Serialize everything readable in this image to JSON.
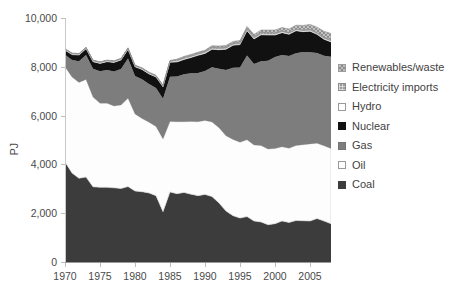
{
  "chart_data": {
    "type": "area",
    "title": "",
    "subtitle": "",
    "xlabel": "",
    "ylabel": "PJ",
    "xlim": [
      1970,
      2008
    ],
    "ylim": [
      0,
      10000
    ],
    "grid": false,
    "stacked": true,
    "legend_position": "right",
    "y_ticks": [
      "0",
      "2,000",
      "4,000",
      "6,000",
      "8,000",
      "10,000"
    ],
    "y_tick_values": [
      0,
      2000,
      4000,
      6000,
      8000,
      10000
    ],
    "x_ticks": [
      "1970",
      "1975",
      "1980",
      "1985",
      "1990",
      "1995",
      "2000",
      "2005"
    ],
    "x_tick_values": [
      1970,
      1975,
      1980,
      1985,
      1990,
      1995,
      2000,
      2005
    ],
    "x": [
      1970,
      1971,
      1972,
      1973,
      1974,
      1975,
      1976,
      1977,
      1978,
      1979,
      1980,
      1981,
      1982,
      1983,
      1984,
      1985,
      1986,
      1987,
      1988,
      1989,
      1990,
      1991,
      1992,
      1993,
      1994,
      1995,
      1996,
      1997,
      1998,
      1999,
      2000,
      2001,
      2002,
      2003,
      2004,
      2005,
      2006,
      2007,
      2008
    ],
    "series": [
      {
        "name": "Coal",
        "color": "#3c3c3c",
        "values": [
          4100,
          3650,
          3430,
          3480,
          3080,
          3060,
          3060,
          3040,
          3010,
          3090,
          2910,
          2880,
          2830,
          2720,
          2060,
          2870,
          2800,
          2850,
          2780,
          2720,
          2770,
          2680,
          2420,
          2090,
          1900,
          1800,
          1860,
          1680,
          1640,
          1530,
          1570,
          1680,
          1620,
          1700,
          1690,
          1680,
          1780,
          1680,
          1570
        ]
      },
      {
        "name": "Oil",
        "color": "#fdfdfd",
        "values": [
          3900,
          3930,
          3930,
          4000,
          3680,
          3450,
          3450,
          3350,
          3420,
          3620,
          3160,
          3000,
          2900,
          2830,
          2980,
          2890,
          2950,
          2900,
          2980,
          3030,
          3030,
          3060,
          3080,
          3080,
          3120,
          3110,
          3150,
          3120,
          3130,
          3100,
          3080,
          3040,
          3040,
          3070,
          3120,
          3160,
          3090,
          3080,
          3080
        ]
      },
      {
        "name": "Gas",
        "color": "#7d7d7d",
        "values": [
          490,
          700,
          870,
          1000,
          1160,
          1310,
          1360,
          1420,
          1480,
          1630,
          1550,
          1610,
          1560,
          1580,
          1650,
          1830,
          1850,
          1940,
          1980,
          2000,
          2030,
          2240,
          2420,
          2700,
          2940,
          3060,
          3450,
          3310,
          3460,
          3620,
          3750,
          3760,
          3780,
          3790,
          3800,
          3760,
          3700,
          3690,
          3760
        ]
      },
      {
        "name": "Nuclear",
        "color": "#111111",
        "values": [
          190,
          220,
          250,
          260,
          290,
          320,
          340,
          370,
          370,
          370,
          380,
          400,
          420,
          450,
          490,
          600,
          600,
          610,
          640,
          720,
          720,
          740,
          780,
          850,
          920,
          940,
          1020,
          1030,
          1080,
          1050,
          900,
          920,
          890,
          920,
          830,
          860,
          760,
          680,
          610
        ]
      },
      {
        "name": "Hydro",
        "color": "#ffffff",
        "values": [
          45,
          45,
          45,
          45,
          45,
          45,
          45,
          45,
          45,
          45,
          45,
          45,
          45,
          45,
          45,
          45,
          45,
          45,
          45,
          45,
          45,
          45,
          45,
          45,
          45,
          45,
          45,
          45,
          45,
          45,
          45,
          45,
          45,
          45,
          45,
          45,
          45,
          45,
          45
        ]
      },
      {
        "name": "Electricity imports",
        "color": "#9b9b9b",
        "values": [
          0,
          0,
          0,
          0,
          0,
          0,
          0,
          0,
          0,
          0,
          0,
          0,
          0,
          0,
          0,
          0,
          40,
          50,
          50,
          50,
          50,
          60,
          60,
          60,
          60,
          60,
          60,
          60,
          60,
          60,
          50,
          40,
          30,
          20,
          30,
          30,
          30,
          40,
          40
        ]
      },
      {
        "name": "Renewables/waste",
        "color": "#bdbdbd",
        "values": [
          20,
          20,
          20,
          20,
          20,
          20,
          20,
          20,
          25,
          25,
          25,
          25,
          25,
          25,
          25,
          25,
          30,
          30,
          30,
          35,
          35,
          40,
          45,
          50,
          55,
          60,
          70,
          80,
          90,
          100,
          110,
          125,
          140,
          160,
          180,
          200,
          220,
          240,
          260
        ]
      }
    ],
    "legend": [
      {
        "label": "Renewables/waste",
        "swatch": "renewables-swatch",
        "color": "#bdbdbd"
      },
      {
        "label": "Electricity imports",
        "swatch": "electricity-imports-swatch",
        "color": "#9b9b9b"
      },
      {
        "label": "Hydro",
        "swatch": "hydro-swatch",
        "color": "#ffffff"
      },
      {
        "label": "Nuclear",
        "swatch": "nuclear-swatch",
        "color": "#111111"
      },
      {
        "label": "Gas",
        "swatch": "gas-swatch",
        "color": "#7d7d7d"
      },
      {
        "label": "Oil",
        "swatch": "oil-swatch",
        "color": "#fdfdfd"
      },
      {
        "label": "Coal",
        "swatch": "coal-swatch",
        "color": "#3c3c3c"
      }
    ]
  }
}
